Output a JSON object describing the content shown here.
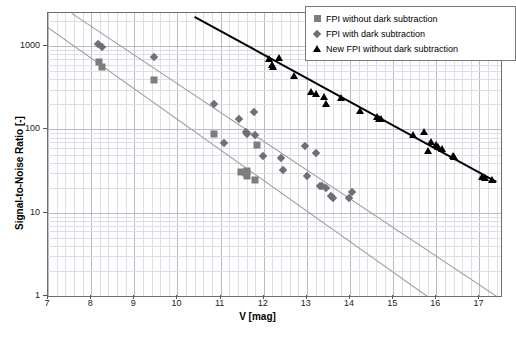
{
  "chart_data": {
    "type": "scatter",
    "title": "",
    "xlabel": "V [mag]",
    "ylabel": "Signal-to-Noise Ratio [-]",
    "xlim": [
      7,
      17.5
    ],
    "ylim": [
      1,
      2500
    ],
    "yscale": "log",
    "xscale": "linear",
    "grid": true,
    "xticks": [
      7,
      8,
      9,
      10,
      11,
      12,
      13,
      14,
      15,
      16,
      17
    ],
    "xtick_labels": [
      "7",
      "8",
      "9",
      "10",
      "11",
      "12",
      "13",
      "14",
      "15",
      "16",
      "17"
    ],
    "yticks": [
      1,
      10,
      100,
      1000
    ],
    "ytick_labels": [
      "1",
      "10",
      "100",
      "1000"
    ],
    "legend_position": "top-right",
    "series": [
      {
        "name": "FPI without dark subtraction",
        "marker": "square",
        "color": "#7d7d7d",
        "points": [
          [
            8.18,
            640
          ],
          [
            8.26,
            560
          ],
          [
            9.45,
            390
          ],
          [
            10.85,
            88
          ],
          [
            11.48,
            31
          ],
          [
            11.58,
            30
          ],
          [
            11.6,
            32
          ],
          [
            11.62,
            28
          ],
          [
            11.8,
            25
          ],
          [
            11.85,
            65
          ]
        ]
      },
      {
        "name": "FPI with dark subtraction",
        "marker": "diamond",
        "color": "#6f6f78",
        "points": [
          [
            8.15,
            1050
          ],
          [
            8.25,
            980
          ],
          [
            9.45,
            740
          ],
          [
            10.85,
            200
          ],
          [
            11.08,
            68
          ],
          [
            11.42,
            132
          ],
          [
            11.58,
            92
          ],
          [
            11.62,
            88
          ],
          [
            11.78,
            160
          ],
          [
            11.8,
            85
          ],
          [
            11.98,
            48
          ],
          [
            12.4,
            45
          ],
          [
            12.45,
            33
          ],
          [
            12.95,
            63
          ],
          [
            13.0,
            28
          ],
          [
            13.2,
            52
          ],
          [
            13.3,
            21
          ],
          [
            13.35,
            21
          ],
          [
            13.45,
            20
          ],
          [
            13.55,
            16
          ],
          [
            13.6,
            15
          ],
          [
            13.98,
            15
          ],
          [
            14.05,
            18
          ]
        ]
      },
      {
        "name": "New FPI without dark subtraction",
        "marker": "triangle",
        "color": "#000000",
        "points": [
          [
            12.12,
            710
          ],
          [
            12.2,
            590
          ],
          [
            12.22,
            560
          ],
          [
            12.35,
            720
          ],
          [
            12.7,
            440
          ],
          [
            13.1,
            285
          ],
          [
            13.22,
            270
          ],
          [
            13.4,
            245
          ],
          [
            13.45,
            205
          ],
          [
            13.78,
            240
          ],
          [
            14.22,
            165
          ],
          [
            14.62,
            140
          ],
          [
            14.68,
            135
          ],
          [
            14.72,
            132
          ],
          [
            15.45,
            85
          ],
          [
            15.72,
            92
          ],
          [
            15.8,
            55
          ],
          [
            15.88,
            70
          ],
          [
            16.0,
            65
          ],
          [
            16.05,
            62
          ],
          [
            16.12,
            58
          ],
          [
            16.38,
            48
          ],
          [
            16.42,
            47
          ],
          [
            17.05,
            27
          ],
          [
            17.12,
            26
          ],
          [
            17.3,
            25
          ]
        ]
      }
    ],
    "trend_lines": [
      {
        "name": "lower-gray-fit",
        "color": "#9a9a9a",
        "p1": [
          7.0,
          1700
        ],
        "p2": [
          15.8,
          1
        ]
      },
      {
        "name": "upper-gray-fit",
        "color": "#9a9a9a",
        "p1": [
          7.55,
          2500
        ],
        "p2": [
          17.4,
          1
        ]
      },
      {
        "name": "black-fit",
        "color": "#000000",
        "p1": [
          10.4,
          2300
        ],
        "p2": [
          17.4,
          24
        ]
      }
    ]
  },
  "legend": {
    "entries": [
      {
        "label": "FPI without dark subtraction",
        "marker": "square"
      },
      {
        "label": "FPI with dark subtraction",
        "marker": "diamond"
      },
      {
        "label": "New FPI without dark subtraction",
        "marker": "triangle"
      }
    ]
  }
}
